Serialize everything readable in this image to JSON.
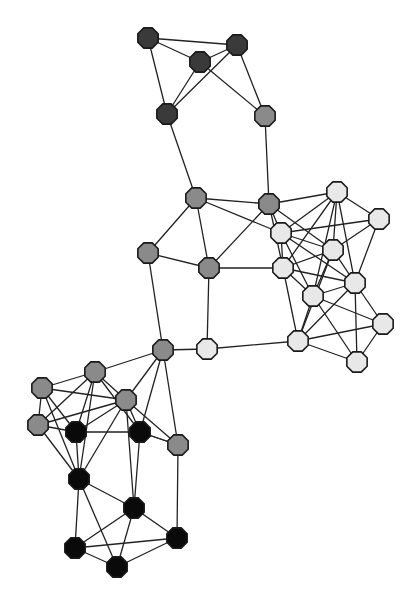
{
  "figure": {
    "background_color": "#ffffff",
    "width": 410,
    "height": 601
  },
  "style": {
    "node_radius": 11,
    "node_sides": 8,
    "node_outline_color": "#1a1a1a",
    "node_outline_width": 1.6,
    "edge_color": "#222222",
    "edge_width": 1.3
  },
  "groups": [
    {
      "id": "dark-gray",
      "label": "Dark gray community",
      "color": "#3a3a3a",
      "count": 4
    },
    {
      "id": "medium-gray",
      "label": "Medium gray community",
      "color": "#8a8a8a",
      "count": 14
    },
    {
      "id": "light-gray",
      "label": "Light gray community",
      "color": "#e8e8e8",
      "count": 12
    },
    {
      "id": "black",
      "label": "Black community",
      "color": "#0a0a0a",
      "count": 7
    }
  ],
  "chart_data": {
    "type": "scatter",
    "xlabel": "",
    "ylabel": "",
    "xlim": [
      0,
      410
    ],
    "ylim": [
      0,
      601
    ],
    "grid": false,
    "legend": "none",
    "nodes": [
      {
        "id": 0,
        "x": 148,
        "y": 38,
        "group": "dark-gray",
        "color": "#3a3a3a"
      },
      {
        "id": 1,
        "x": 200,
        "y": 62,
        "group": "dark-gray",
        "color": "#3a3a3a"
      },
      {
        "id": 2,
        "x": 237,
        "y": 45,
        "group": "dark-gray",
        "color": "#3a3a3a"
      },
      {
        "id": 3,
        "x": 167,
        "y": 114,
        "group": "dark-gray",
        "color": "#3a3a3a"
      },
      {
        "id": 4,
        "x": 265,
        "y": 116,
        "group": "medium-gray",
        "color": "#8a8a8a"
      },
      {
        "id": 5,
        "x": 196,
        "y": 198,
        "group": "medium-gray",
        "color": "#8a8a8a"
      },
      {
        "id": 6,
        "x": 269,
        "y": 204,
        "group": "medium-gray",
        "color": "#8a8a8a"
      },
      {
        "id": 7,
        "x": 148,
        "y": 253,
        "group": "medium-gray",
        "color": "#8a8a8a"
      },
      {
        "id": 8,
        "x": 209,
        "y": 268,
        "group": "medium-gray",
        "color": "#8a8a8a"
      },
      {
        "id": 9,
        "x": 163,
        "y": 350,
        "group": "medium-gray",
        "color": "#8a8a8a"
      },
      {
        "id": 10,
        "x": 281,
        "y": 233,
        "group": "light-gray",
        "color": "#e8e8e8"
      },
      {
        "id": 11,
        "x": 337,
        "y": 192,
        "group": "light-gray",
        "color": "#e8e8e8"
      },
      {
        "id": 12,
        "x": 379,
        "y": 219,
        "group": "light-gray",
        "color": "#e8e8e8"
      },
      {
        "id": 13,
        "x": 333,
        "y": 250,
        "group": "light-gray",
        "color": "#e8e8e8"
      },
      {
        "id": 14,
        "x": 283,
        "y": 268,
        "group": "light-gray",
        "color": "#e8e8e8"
      },
      {
        "id": 15,
        "x": 355,
        "y": 283,
        "group": "light-gray",
        "color": "#e8e8e8"
      },
      {
        "id": 16,
        "x": 313,
        "y": 296,
        "group": "light-gray",
        "color": "#e8e8e8"
      },
      {
        "id": 17,
        "x": 383,
        "y": 324,
        "group": "light-gray",
        "color": "#e8e8e8"
      },
      {
        "id": 18,
        "x": 298,
        "y": 341,
        "group": "light-gray",
        "color": "#e8e8e8"
      },
      {
        "id": 19,
        "x": 357,
        "y": 362,
        "group": "light-gray",
        "color": "#e8e8e8"
      },
      {
        "id": 20,
        "x": 207,
        "y": 349,
        "group": "light-gray",
        "color": "#e8e8e8"
      },
      {
        "id": 21,
        "x": 95,
        "y": 372,
        "group": "medium-gray",
        "color": "#8a8a8a"
      },
      {
        "id": 22,
        "x": 42,
        "y": 388,
        "group": "medium-gray",
        "color": "#8a8a8a"
      },
      {
        "id": 23,
        "x": 38,
        "y": 425,
        "group": "medium-gray",
        "color": "#8a8a8a"
      },
      {
        "id": 24,
        "x": 126,
        "y": 400,
        "group": "medium-gray",
        "color": "#8a8a8a"
      },
      {
        "id": 25,
        "x": 178,
        "y": 445,
        "group": "medium-gray",
        "color": "#8a8a8a"
      },
      {
        "id": 26,
        "x": 76,
        "y": 432,
        "group": "black",
        "color": "#0a0a0a"
      },
      {
        "id": 27,
        "x": 140,
        "y": 432,
        "group": "black",
        "color": "#0a0a0a"
      },
      {
        "id": 28,
        "x": 79,
        "y": 479,
        "group": "black",
        "color": "#0a0a0a"
      },
      {
        "id": 29,
        "x": 134,
        "y": 508,
        "group": "black",
        "color": "#0a0a0a"
      },
      {
        "id": 30,
        "x": 75,
        "y": 548,
        "group": "black",
        "color": "#0a0a0a"
      },
      {
        "id": 31,
        "x": 117,
        "y": 567,
        "group": "black",
        "color": "#0a0a0a"
      },
      {
        "id": 32,
        "x": 177,
        "y": 538,
        "group": "black",
        "color": "#0a0a0a"
      }
    ],
    "edges": [
      [
        0,
        1
      ],
      [
        0,
        2
      ],
      [
        0,
        3
      ],
      [
        1,
        2
      ],
      [
        1,
        3
      ],
      [
        1,
        4
      ],
      [
        2,
        3
      ],
      [
        2,
        4
      ],
      [
        3,
        5
      ],
      [
        4,
        6
      ],
      [
        5,
        6
      ],
      [
        5,
        7
      ],
      [
        5,
        8
      ],
      [
        5,
        10
      ],
      [
        6,
        8
      ],
      [
        6,
        10
      ],
      [
        6,
        11
      ],
      [
        6,
        13
      ],
      [
        6,
        14
      ],
      [
        7,
        8
      ],
      [
        7,
        9
      ],
      [
        8,
        14
      ],
      [
        8,
        20
      ],
      [
        9,
        20
      ],
      [
        9,
        21
      ],
      [
        9,
        24
      ],
      [
        9,
        25
      ],
      [
        9,
        27
      ],
      [
        10,
        11
      ],
      [
        10,
        13
      ],
      [
        10,
        14
      ],
      [
        10,
        15
      ],
      [
        10,
        16
      ],
      [
        10,
        12
      ],
      [
        11,
        12
      ],
      [
        11,
        13
      ],
      [
        11,
        14
      ],
      [
        11,
        15
      ],
      [
        11,
        16
      ],
      [
        12,
        13
      ],
      [
        12,
        15
      ],
      [
        13,
        14
      ],
      [
        13,
        15
      ],
      [
        13,
        16
      ],
      [
        13,
        18
      ],
      [
        14,
        15
      ],
      [
        14,
        16
      ],
      [
        14,
        18
      ],
      [
        15,
        16
      ],
      [
        15,
        17
      ],
      [
        15,
        18
      ],
      [
        15,
        19
      ],
      [
        16,
        17
      ],
      [
        16,
        18
      ],
      [
        16,
        19
      ],
      [
        17,
        19
      ],
      [
        18,
        19
      ],
      [
        18,
        17
      ],
      [
        20,
        18
      ],
      [
        21,
        22
      ],
      [
        21,
        23
      ],
      [
        21,
        24
      ],
      [
        21,
        26
      ],
      [
        21,
        27
      ],
      [
        21,
        28
      ],
      [
        22,
        23
      ],
      [
        22,
        24
      ],
      [
        22,
        26
      ],
      [
        22,
        28
      ],
      [
        23,
        24
      ],
      [
        23,
        26
      ],
      [
        23,
        28
      ],
      [
        24,
        26
      ],
      [
        24,
        27
      ],
      [
        24,
        28
      ],
      [
        24,
        29
      ],
      [
        24,
        25
      ],
      [
        25,
        27
      ],
      [
        25,
        32
      ],
      [
        26,
        27
      ],
      [
        26,
        28
      ],
      [
        27,
        29
      ],
      [
        27,
        25
      ],
      [
        28,
        29
      ],
      [
        28,
        30
      ],
      [
        28,
        31
      ],
      [
        29,
        30
      ],
      [
        29,
        31
      ],
      [
        29,
        32
      ],
      [
        30,
        31
      ],
      [
        30,
        32
      ],
      [
        31,
        32
      ]
    ]
  }
}
